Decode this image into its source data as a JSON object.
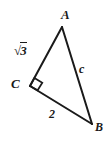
{
  "figure": {
    "type": "right-triangle-geometry-diagram",
    "background_color": "#ffffff",
    "stroke_color": "#1a1a1a",
    "stroke_width": 2,
    "vertices": {
      "A": {
        "label": "A",
        "x": 62,
        "y": 27
      },
      "B": {
        "label": "B",
        "x": 92,
        "y": 124
      },
      "C": {
        "label": "C",
        "x": 30,
        "y": 86
      }
    },
    "sides": [
      {
        "name": "CA",
        "label": "√3",
        "radical": true,
        "radicand": "3",
        "from": "C",
        "to": "A"
      },
      {
        "name": "AB",
        "label": "c",
        "from": "A",
        "to": "B"
      },
      {
        "name": "CB",
        "label": "2",
        "from": "C",
        "to": "B"
      }
    ],
    "right_angle": {
      "at_vertex": "C",
      "marker": "square",
      "size": 9
    }
  },
  "labels": {
    "vertex_a": "A",
    "vertex_b": "B",
    "vertex_c": "C",
    "side_hypotenuse": "c",
    "side_base": "2",
    "side_vertical_radical": "√",
    "side_vertical_radicand": "3"
  }
}
